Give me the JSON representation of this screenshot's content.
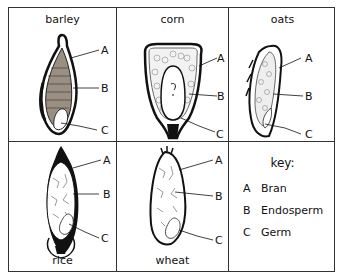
{
  "grains": [
    {
      "name": "barley",
      "labels": [
        "A",
        "B",
        "C"
      ]
    },
    {
      "name": "corn",
      "labels": [
        "A",
        "B",
        "C"
      ]
    },
    {
      "name": "oats",
      "labels": [
        "A",
        "B",
        "C"
      ]
    },
    {
      "name": "rice",
      "labels": [
        "A",
        "B",
        "C"
      ]
    },
    {
      "name": "wheat",
      "labels": [
        "A",
        "B",
        "C"
      ]
    }
  ],
  "key": {
    "title": "key:",
    "items": [
      {
        "letter": "A",
        "part": "Bran"
      },
      {
        "letter": "B",
        "part": "Endosperm"
      },
      {
        "letter": "C",
        "part": "Germ"
      }
    ]
  }
}
